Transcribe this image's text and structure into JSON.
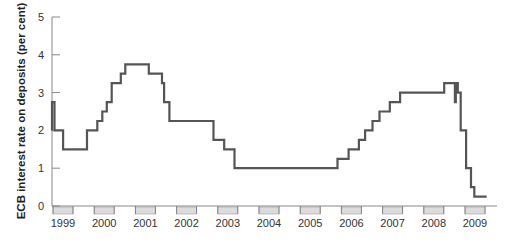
{
  "chart_data": {
    "type": "line",
    "subtype": "step",
    "title": "",
    "xlabel": "",
    "ylabel": "ECB interest rate on deposits (per cent)",
    "ylim": [
      0,
      5
    ],
    "yticks": [
      0,
      1,
      2,
      3,
      4,
      5
    ],
    "xlim": [
      1999.0,
      2009.75
    ],
    "xticks": [
      "1999",
      "2000",
      "2001",
      "2002",
      "2003",
      "2004",
      "2005",
      "2006",
      "2007",
      "2008",
      "2009"
    ],
    "grid": false,
    "legend": null,
    "line_color": "#555555",
    "year_band_color": "#dcdcdc",
    "series": [
      {
        "name": "ECB deposit facility rate",
        "points": [
          {
            "x": 1999.0,
            "y": 2.0
          },
          {
            "x": 1999.0,
            "y": 2.75
          },
          {
            "x": 1999.06,
            "y": 2.75
          },
          {
            "x": 1999.06,
            "y": 2.0
          },
          {
            "x": 1999.27,
            "y": 2.0
          },
          {
            "x": 1999.27,
            "y": 1.5
          },
          {
            "x": 1999.85,
            "y": 1.5
          },
          {
            "x": 1999.85,
            "y": 2.0
          },
          {
            "x": 2000.1,
            "y": 2.0
          },
          {
            "x": 2000.1,
            "y": 2.25
          },
          {
            "x": 2000.22,
            "y": 2.25
          },
          {
            "x": 2000.22,
            "y": 2.5
          },
          {
            "x": 2000.33,
            "y": 2.5
          },
          {
            "x": 2000.33,
            "y": 2.75
          },
          {
            "x": 2000.45,
            "y": 2.75
          },
          {
            "x": 2000.45,
            "y": 3.25
          },
          {
            "x": 2000.67,
            "y": 3.25
          },
          {
            "x": 2000.67,
            "y": 3.5
          },
          {
            "x": 2000.78,
            "y": 3.5
          },
          {
            "x": 2000.78,
            "y": 3.75
          },
          {
            "x": 2001.35,
            "y": 3.75
          },
          {
            "x": 2001.35,
            "y": 3.5
          },
          {
            "x": 2001.67,
            "y": 3.5
          },
          {
            "x": 2001.67,
            "y": 3.25
          },
          {
            "x": 2001.72,
            "y": 3.25
          },
          {
            "x": 2001.72,
            "y": 2.75
          },
          {
            "x": 2001.85,
            "y": 2.75
          },
          {
            "x": 2001.85,
            "y": 2.25
          },
          {
            "x": 2002.92,
            "y": 2.25
          },
          {
            "x": 2002.92,
            "y": 1.75
          },
          {
            "x": 2003.18,
            "y": 1.75
          },
          {
            "x": 2003.18,
            "y": 1.5
          },
          {
            "x": 2003.43,
            "y": 1.5
          },
          {
            "x": 2003.43,
            "y": 1.0
          },
          {
            "x": 2005.93,
            "y": 1.0
          },
          {
            "x": 2005.93,
            "y": 1.25
          },
          {
            "x": 2006.2,
            "y": 1.25
          },
          {
            "x": 2006.2,
            "y": 1.5
          },
          {
            "x": 2006.45,
            "y": 1.5
          },
          {
            "x": 2006.45,
            "y": 1.75
          },
          {
            "x": 2006.6,
            "y": 1.75
          },
          {
            "x": 2006.6,
            "y": 2.0
          },
          {
            "x": 2006.78,
            "y": 2.0
          },
          {
            "x": 2006.78,
            "y": 2.25
          },
          {
            "x": 2006.95,
            "y": 2.25
          },
          {
            "x": 2006.95,
            "y": 2.5
          },
          {
            "x": 2007.2,
            "y": 2.5
          },
          {
            "x": 2007.2,
            "y": 2.75
          },
          {
            "x": 2007.45,
            "y": 2.75
          },
          {
            "x": 2007.45,
            "y": 3.0
          },
          {
            "x": 2008.52,
            "y": 3.0
          },
          {
            "x": 2008.52,
            "y": 3.25
          },
          {
            "x": 2008.78,
            "y": 3.25
          },
          {
            "x": 2008.78,
            "y": 2.75
          },
          {
            "x": 2008.8,
            "y": 2.75
          },
          {
            "x": 2008.8,
            "y": 3.25
          },
          {
            "x": 2008.85,
            "y": 3.25
          },
          {
            "x": 2008.85,
            "y": 3.0
          },
          {
            "x": 2008.92,
            "y": 3.0
          },
          {
            "x": 2008.92,
            "y": 2.0
          },
          {
            "x": 2009.05,
            "y": 2.0
          },
          {
            "x": 2009.05,
            "y": 1.0
          },
          {
            "x": 2009.17,
            "y": 1.0
          },
          {
            "x": 2009.17,
            "y": 0.5
          },
          {
            "x": 2009.25,
            "y": 0.5
          },
          {
            "x": 2009.25,
            "y": 0.25
          },
          {
            "x": 2009.55,
            "y": 0.25
          }
        ]
      }
    ]
  }
}
